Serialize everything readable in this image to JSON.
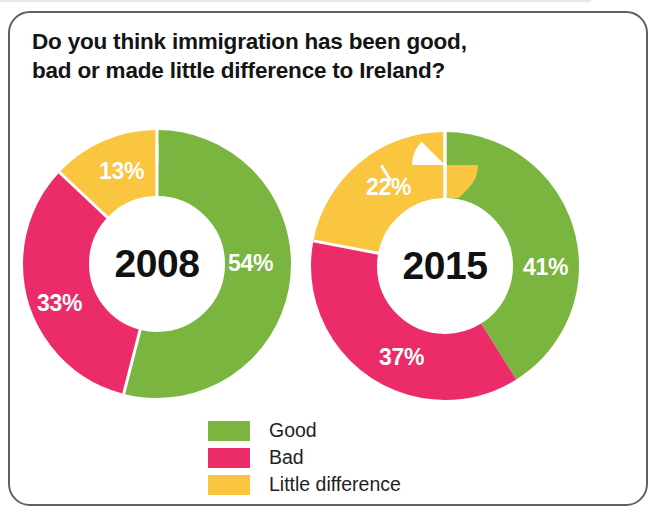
{
  "frame": {
    "border_color": "#55636f"
  },
  "header": {
    "title_line1": "Do you think immigration has been good,",
    "title_line2": "bad or made little difference to Ireland?"
  },
  "legend": {
    "items": [
      {
        "label": "Good",
        "color": "#7ab53f"
      },
      {
        "label": "Bad",
        "color": "#ec2c69"
      },
      {
        "label": "Little difference",
        "color": "#fac63f"
      }
    ]
  },
  "donuts": [
    {
      "center_label": "2008",
      "good_pct": "54%",
      "bad_pct": "33%",
      "little_pct": "13%"
    },
    {
      "center_label": "2015",
      "good_pct": "41%",
      "bad_pct": "37%",
      "little_pct": "22%"
    }
  ],
  "chart_data": {
    "type": "pie",
    "title": "Do you think immigration has been good, bad or made little difference to Ireland?",
    "subtitle": "",
    "xlabel": "",
    "ylabel": "",
    "units": "percent",
    "legend_position": "bottom-center",
    "grid": false,
    "donut_hole_ratio": 0.56,
    "start_angle_deg": 0,
    "direction": "clockwise",
    "categories": [
      "Good",
      "Bad",
      "Little difference"
    ],
    "colors": [
      "#7ab53f",
      "#ec2c69",
      "#fac63f"
    ],
    "charts": [
      {
        "name": "2008",
        "center_label": "2008",
        "values": [
          54,
          33,
          13
        ],
        "labels": [
          "54%",
          "33%",
          "13%"
        ]
      },
      {
        "name": "2015",
        "center_label": "2015",
        "values": [
          41,
          37,
          22
        ],
        "labels": [
          "41%",
          "37%",
          "22%"
        ]
      }
    ]
  }
}
